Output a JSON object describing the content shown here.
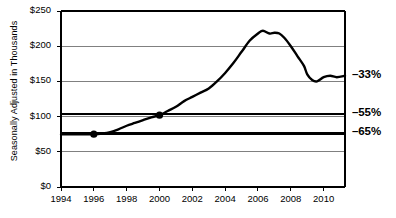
{
  "chart_data": {
    "type": "line",
    "title": "",
    "xlabel": "",
    "ylabel": "Seasonally Adjusted in Thousands",
    "xlim": [
      1994,
      2011.3
    ],
    "ylim": [
      0,
      250
    ],
    "grid": true,
    "legend": false,
    "y_ticks": [
      {
        "value": 0,
        "label": "$0"
      },
      {
        "value": 50,
        "label": "$50"
      },
      {
        "value": 100,
        "label": "$100"
      },
      {
        "value": 150,
        "label": "$150"
      },
      {
        "value": 200,
        "label": "$200"
      },
      {
        "value": 250,
        "label": "$250"
      }
    ],
    "x_ticks": [
      {
        "value": 1994,
        "label": "1994"
      },
      {
        "value": 1996,
        "label": "1996"
      },
      {
        "value": 1998,
        "label": "1998"
      },
      {
        "value": 2000,
        "label": "2000"
      },
      {
        "value": 2002,
        "label": "2002"
      },
      {
        "value": 2004,
        "label": "2004"
      },
      {
        "value": 2006,
        "label": "2006"
      },
      {
        "value": 2008,
        "label": "2008"
      },
      {
        "value": 2010,
        "label": "2010"
      }
    ],
    "series": [
      {
        "name": "Seasonally adjusted series",
        "color": "#000000",
        "x": [
          1994.0,
          1994.5,
          1995.0,
          1995.5,
          1996.0,
          1996.5,
          1997.0,
          1997.5,
          1998.0,
          1998.5,
          1999.0,
          1999.5,
          2000.0,
          2000.5,
          2001.0,
          2001.5,
          2002.0,
          2002.5,
          2003.0,
          2003.5,
          2004.0,
          2004.5,
          2005.0,
          2005.5,
          2006.0,
          2006.3,
          2006.7,
          2007.0,
          2007.3,
          2007.6,
          2008.0,
          2008.4,
          2008.8,
          2009.0,
          2009.3,
          2009.6,
          2010.0,
          2010.4,
          2010.8,
          2011.3
        ],
        "y": [
          75,
          75,
          75,
          75,
          75,
          76,
          78,
          82,
          87,
          91,
          95,
          99,
          102,
          108,
          114,
          122,
          128,
          134,
          140,
          150,
          162,
          176,
          192,
          208,
          218,
          222,
          218,
          219,
          218,
          212,
          200,
          186,
          172,
          160,
          152,
          150,
          156,
          158,
          156,
          158
        ]
      }
    ],
    "reference_lines": [
      {
        "name": "minus-55-line",
        "y": 104,
        "label": "–55%",
        "color": "#000000",
        "width": 2.4
      },
      {
        "name": "minus-65-line",
        "y": 76,
        "label": "–65%",
        "color": "#000000",
        "width": 2.4
      }
    ],
    "annotations": [
      {
        "name": "minus-33-label",
        "label": "–33%",
        "y": 157
      }
    ],
    "markers": [
      {
        "name": "marker-1996",
        "x": 1996.0,
        "y": 75
      },
      {
        "name": "marker-2000",
        "x": 2000.0,
        "y": 102
      }
    ]
  }
}
